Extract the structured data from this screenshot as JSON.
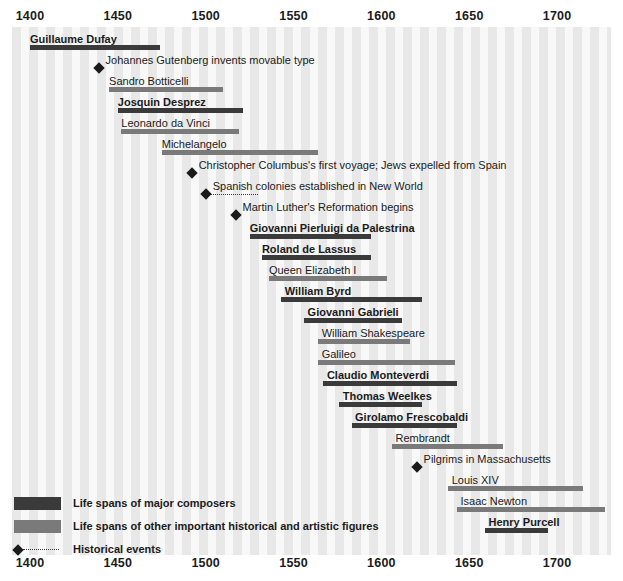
{
  "chart_data": {
    "type": "bar",
    "title": "",
    "subtitle": "",
    "xlabel": "",
    "ylabel": "",
    "xlim": [
      1395,
      1720
    ],
    "axis_ticks": [
      1400,
      1450,
      1500,
      1550,
      1600,
      1650,
      1700
    ],
    "axis_tick_labels": [
      "1400",
      "1450",
      "1500",
      "1550",
      "1600",
      "1650",
      "1700"
    ],
    "grid": "vertical-stripes",
    "legend_position": "bottom-left",
    "colors": {
      "composer": "#3a3a3a",
      "figure": "#7a7a7a",
      "event": "#1b1b1b",
      "stripe_dark": "#e8e8e8",
      "stripe_light": "#f8f8f8",
      "text": "#1b1b1b",
      "background": "#ffffff"
    },
    "series": [
      {
        "name": "Guillaume Dufay",
        "kind": "composer",
        "start": 1400,
        "end": 1474,
        "label_x": 1400
      },
      {
        "name": "Johannes Gutenberg invents movable type",
        "kind": "event",
        "start": 1439,
        "end": 1439,
        "label_x": 1443
      },
      {
        "name": "Sandro Botticelli",
        "kind": "figure",
        "start": 1445,
        "end": 1510,
        "label_x": 1445
      },
      {
        "name": "Josquin Desprez",
        "kind": "composer",
        "start": 1450,
        "end": 1521,
        "label_x": 1450
      },
      {
        "name": "Leonardo da Vinci",
        "kind": "figure",
        "start": 1452,
        "end": 1519,
        "label_x": 1452
      },
      {
        "name": "Michelangelo",
        "kind": "figure",
        "start": 1475,
        "end": 1564,
        "label_x": 1475
      },
      {
        "name": "Christopher Columbus's first voyage; Jews expelled from Spain",
        "kind": "event",
        "start": 1492,
        "end": 1492,
        "label_x": 1496
      },
      {
        "name": "Spanish colonies established in New World",
        "kind": "event",
        "start": 1500,
        "end": 1530,
        "label_x": 1504
      },
      {
        "name": "Martin Luther's Reformation begins",
        "kind": "event",
        "start": 1517,
        "end": 1517,
        "label_x": 1521
      },
      {
        "name": "Giovanni Pierluigi da Palestrina",
        "kind": "composer",
        "start": 1525,
        "end": 1594,
        "label_x": 1525
      },
      {
        "name": "Roland de Lassus",
        "kind": "composer",
        "start": 1532,
        "end": 1594,
        "label_x": 1532
      },
      {
        "name": "Queen Elizabeth I",
        "kind": "figure",
        "start": 1536,
        "end": 1603,
        "label_x": 1536
      },
      {
        "name": "William Byrd",
        "kind": "composer",
        "start": 1543,
        "end": 1623,
        "label_x": 1545
      },
      {
        "name": "Giovanni Gabrieli",
        "kind": "composer",
        "start": 1556,
        "end": 1612,
        "label_x": 1558
      },
      {
        "name": "William Shakespeare",
        "kind": "figure",
        "start": 1564,
        "end": 1616,
        "label_x": 1566
      },
      {
        "name": "Galileo",
        "kind": "figure",
        "start": 1564,
        "end": 1642,
        "label_x": 1566
      },
      {
        "name": "Claudio Monteverdi",
        "kind": "composer",
        "start": 1567,
        "end": 1643,
        "label_x": 1569
      },
      {
        "name": "Thomas Weelkes",
        "kind": "composer",
        "start": 1576,
        "end": 1623,
        "label_x": 1578
      },
      {
        "name": "Girolamo Frescobaldi",
        "kind": "composer",
        "start": 1583,
        "end": 1643,
        "label_x": 1585
      },
      {
        "name": "Rembrandt",
        "kind": "figure",
        "start": 1606,
        "end": 1669,
        "label_x": 1608
      },
      {
        "name": "Pilgrims in Massachusetts",
        "kind": "event",
        "start": 1620,
        "end": 1620,
        "label_x": 1624
      },
      {
        "name": "Louis XIV",
        "kind": "figure",
        "start": 1638,
        "end": 1715,
        "label_x": 1640
      },
      {
        "name": "Isaac Newton",
        "kind": "figure",
        "start": 1643,
        "end": 1727,
        "label_x": 1645
      },
      {
        "name": "Henry Purcell",
        "kind": "composer",
        "start": 1659,
        "end": 1695,
        "label_x": 1661
      }
    ]
  },
  "legend": {
    "items": [
      {
        "marker": "composer-swatch",
        "label": "Life spans of major composers"
      },
      {
        "marker": "figure-swatch",
        "label": "Life spans of other important historical and artistic figures"
      },
      {
        "marker": "event-marker",
        "label": "Historical events"
      }
    ]
  }
}
